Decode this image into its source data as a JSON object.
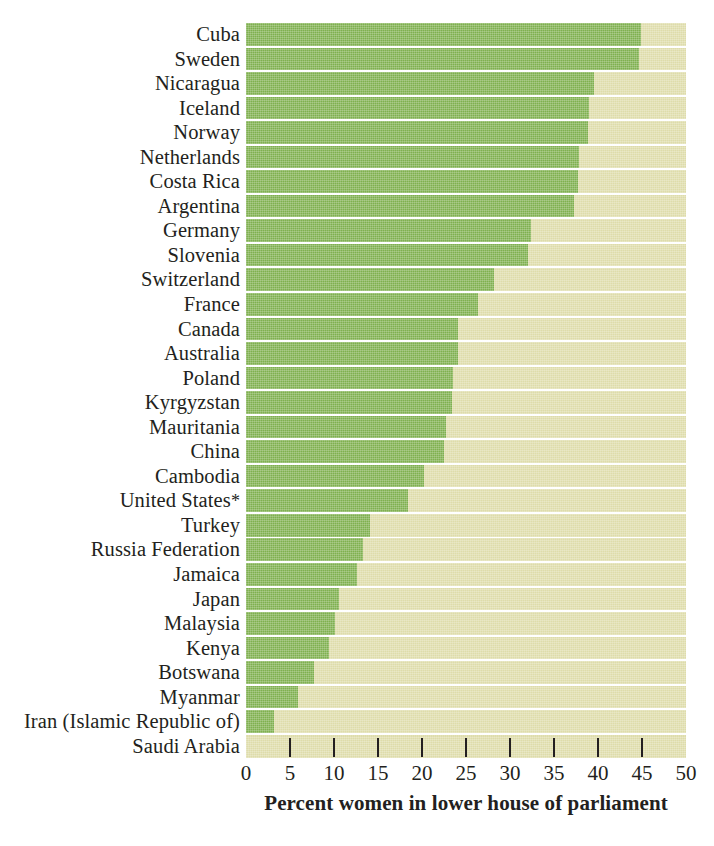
{
  "chart_data": {
    "type": "bar",
    "orientation": "horizontal",
    "title": "",
    "subtitle": "",
    "xlabel": "Percent women in lower house of parliament",
    "ylabel": "",
    "xlim": [
      0,
      50
    ],
    "xticks": [
      0,
      5,
      10,
      15,
      20,
      25,
      30,
      35,
      40,
      45,
      50
    ],
    "xtick_labels": [
      "0",
      "5",
      "10",
      "15",
      "20",
      "25",
      "30",
      "35",
      "40",
      "45",
      "50"
    ],
    "grid": false,
    "legend": null,
    "bar_color": "#7fb04f",
    "track_color": "#dedcaa",
    "categories": [
      "Cuba",
      "Sweden",
      "Nicaragua",
      "Iceland",
      "Norway",
      "Netherlands",
      "Costa Rica",
      "Argentina",
      "Germany",
      "Slovenia",
      "Switzerland",
      "France",
      "Canada",
      "Australia",
      "Poland",
      "Kyrgyzstan",
      "Mauritania",
      "China",
      "Cambodia",
      "United States*",
      "Turkey",
      "Russia Federation",
      "Jamaica",
      "Japan",
      "Malaysia",
      "Kenya",
      "Botswana",
      "Myanmar",
      "Iran (Islamic Republic of)",
      "Saudi Arabia"
    ],
    "values": [
      44.9,
      44.7,
      39.5,
      39.0,
      38.9,
      37.8,
      37.7,
      37.3,
      32.4,
      32.0,
      28.2,
      26.4,
      24.1,
      24.1,
      23.5,
      23.4,
      22.7,
      22.5,
      20.2,
      18.4,
      14.1,
      13.3,
      12.6,
      10.6,
      10.1,
      9.4,
      7.7,
      5.9,
      3.2,
      0.0
    ]
  },
  "axis": {
    "title": "Percent women in lower house of parliament"
  },
  "footnote_marker": "*"
}
